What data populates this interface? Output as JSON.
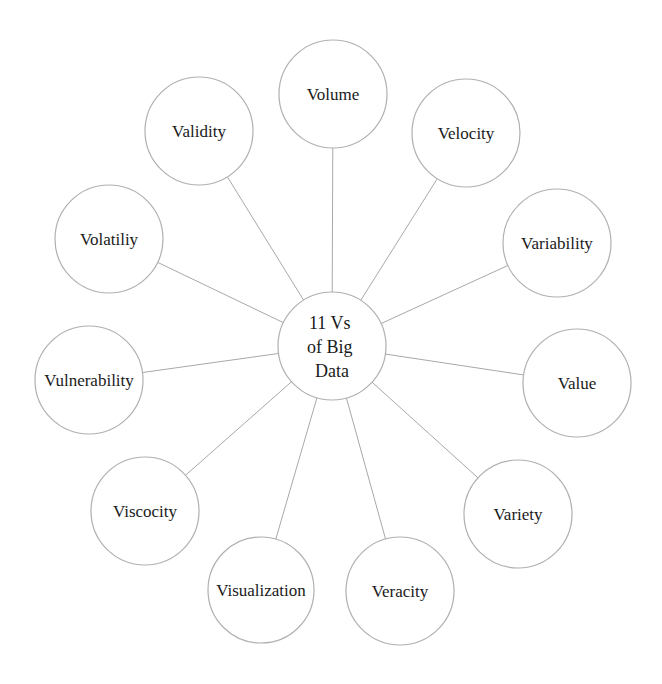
{
  "diagram": {
    "type": "radial-mind-map",
    "colors": {
      "background": "#ffffff",
      "line": "#a8a8a8",
      "circle_stroke": "#b0b0b0",
      "text": "#1a1a1a"
    },
    "center": {
      "lines": [
        "11 Vs",
        "of Big",
        "Data"
      ],
      "cx": 332,
      "cy": 346,
      "r": 54
    },
    "nodes": [
      {
        "label": "Volume",
        "cx": 333,
        "cy": 94,
        "r": 54
      },
      {
        "label": "Velocity",
        "cx": 466,
        "cy": 133,
        "r": 54
      },
      {
        "label": "Variability",
        "cx": 557,
        "cy": 243,
        "r": 54
      },
      {
        "label": "Value",
        "cx": 577,
        "cy": 383,
        "r": 54
      },
      {
        "label": "Variety",
        "cx": 518,
        "cy": 514,
        "r": 54
      },
      {
        "label": "Veracity",
        "cx": 400,
        "cy": 591,
        "r": 54
      },
      {
        "label": "Visualization",
        "cx": 261,
        "cy": 590,
        "r": 53
      },
      {
        "label": "Viscocity",
        "cx": 145,
        "cy": 511,
        "r": 54
      },
      {
        "label": "Vulnerability",
        "cx": 89,
        "cy": 380,
        "r": 54
      },
      {
        "label": "Volatiliy",
        "cx": 109,
        "cy": 239,
        "r": 54
      },
      {
        "label": "Validity",
        "cx": 199,
        "cy": 131,
        "r": 54
      }
    ]
  }
}
